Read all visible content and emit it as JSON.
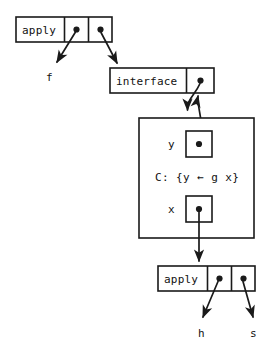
{
  "diagram": {
    "background_color": "#ffffff",
    "ink_color": "#1a1a1a",
    "nodes": {
      "top_apply": {
        "label": "apply",
        "slot_1_pointer": "pointer-dot",
        "slot_2_pointer": "pointer-dot"
      },
      "interface": {
        "label": "interface",
        "slot_1_pointer": "pointer-dot"
      },
      "environment_frame": {
        "binding_y_label": "y",
        "binding_y_pointer": "pointer-dot",
        "closure_text": "C: {y ← g x}",
        "binding_x_label": "x",
        "binding_x_pointer": "pointer-dot"
      },
      "bottom_apply": {
        "label": "apply",
        "slot_1_pointer": "pointer-dot",
        "slot_2_pointer": "pointer-dot"
      }
    },
    "terminals": {
      "f": "f",
      "h": "h",
      "s": "s"
    }
  }
}
